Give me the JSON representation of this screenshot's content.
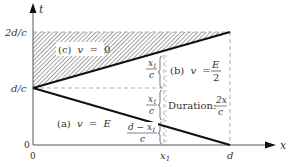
{
  "axes": {
    "x_label": "x",
    "t_label": "t",
    "origin_x_label": "0",
    "origin_t_label": "0"
  },
  "t_ticks": {
    "two_d_over_c": "2d/c",
    "d_over_c": "d/c"
  },
  "x_ticks": {
    "x1": "x",
    "x1_sub": "1",
    "d": "d"
  },
  "regions": {
    "c": {
      "prefix": "(c)",
      "var": "v",
      "eq": "=",
      "value": "0"
    },
    "b": {
      "prefix": "(b)",
      "var": "v",
      "eq": "=",
      "num": "E",
      "den": "2"
    },
    "a": {
      "prefix": "(a)",
      "var": "v",
      "eq": "=",
      "value": "E"
    }
  },
  "brace_labels": {
    "upper": {
      "num": "x",
      "num_sub": "1",
      "den": "c"
    },
    "middle": {
      "num": "x",
      "num_sub": "1",
      "den": "c"
    },
    "lower": {
      "num": "d − x",
      "num_sub": "1",
      "den": "c"
    }
  },
  "duration": {
    "label": "Duration:",
    "num": "2x",
    "den": "c"
  },
  "colors": {
    "line": "#111111",
    "dashed": "#888888",
    "hatch": "#555555",
    "text": "#333333"
  }
}
